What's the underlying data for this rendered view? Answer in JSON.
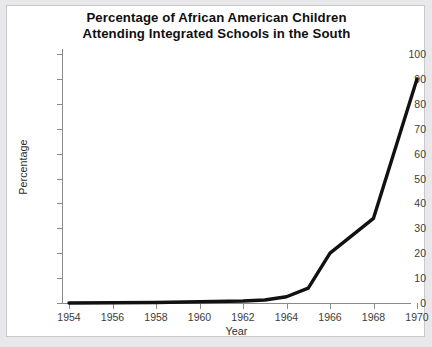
{
  "figure": {
    "title_line1": "Percentage of African American Children",
    "title_line2": "Attending Integrated Schools in the South",
    "line_color": "#111111",
    "axis_color": "#8a8a8e",
    "background": "#ffffff",
    "page_tint": "#e8e8ea"
  },
  "chart_data": {
    "type": "line",
    "title": "Percentage of African American Children Attending Integrated Schools in the South",
    "xlabel": "Year",
    "ylabel": "Percentage",
    "xlim": [
      1954,
      1970
    ],
    "ylim": [
      0,
      100
    ],
    "grid": false,
    "legend": "none",
    "xticks": [
      1954,
      1956,
      1958,
      1960,
      1962,
      1964,
      1966,
      1968,
      1970
    ],
    "xtick_labels": [
      "1954",
      "1956",
      "1958",
      "1960",
      "1962",
      "1964",
      "1966",
      "1968",
      "1970"
    ],
    "yticks": [
      0,
      10,
      20,
      30,
      40,
      50,
      60,
      70,
      80,
      90,
      100
    ],
    "ytick_labels": [
      "0",
      "10",
      "20",
      "30",
      "40",
      "50",
      "60",
      "70",
      "80",
      "90",
      "100"
    ],
    "x": [
      1954,
      1958,
      1962,
      1963,
      1964,
      1965,
      1966,
      1968,
      1970
    ],
    "values": [
      0,
      0.2,
      0.8,
      1.2,
      2.5,
      6,
      20,
      34,
      90
    ],
    "series": [
      {
        "name": "Percentage attending integrated schools",
        "x": [
          1954,
          1958,
          1962,
          1963,
          1964,
          1965,
          1966,
          1968,
          1970
        ],
        "values": [
          0,
          0.2,
          0.8,
          1.2,
          2.5,
          6,
          20,
          34,
          90
        ]
      }
    ]
  }
}
